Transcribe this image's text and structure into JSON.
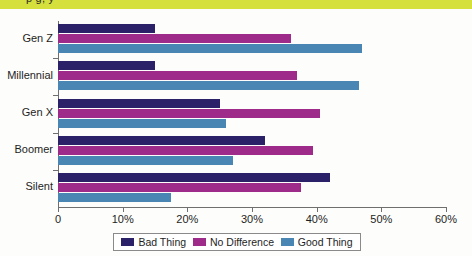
{
  "banner": {
    "text": "p                                                                g, y"
  },
  "chart_data": {
    "type": "bar",
    "orientation": "horizontal",
    "title": "",
    "xlabel": "",
    "ylabel": "",
    "categories": [
      "Gen Z",
      "Millennial",
      "Gen X",
      "Boomer",
      "Silent"
    ],
    "series": [
      {
        "name": "Bad Thing",
        "color": "#2b2168",
        "values": [
          15,
          15,
          25,
          32,
          42
        ]
      },
      {
        "name": "No Difference",
        "color": "#9e2a8a",
        "values": [
          36,
          37,
          40.5,
          39.5,
          37.5
        ]
      },
      {
        "name": "Good Thing",
        "color": "#4a86b4",
        "values": [
          47,
          46.5,
          26,
          27,
          17.5
        ]
      }
    ],
    "xlim": [
      0,
      60
    ],
    "xticks": [
      0,
      10,
      20,
      30,
      40,
      50,
      60
    ],
    "xtick_labels": [
      "0",
      "10%",
      "20%",
      "30%",
      "40%",
      "50%",
      "60%"
    ],
    "grid": false,
    "legend_position": "bottom"
  },
  "colors": {
    "banner": "#d6e03c",
    "axis": "#6f6f6f",
    "background": "#fdfdfb"
  }
}
